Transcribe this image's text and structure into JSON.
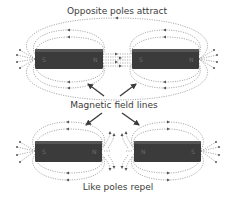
{
  "labels": {
    "top": "Opposite poles attract",
    "middle": "Magnetic field lines",
    "bottom": "Like poles repel"
  },
  "magnets": {
    "attract": [
      {
        "left_pole": "S",
        "right_pole": "N"
      },
      {
        "left_pole": "S",
        "right_pole": "N"
      }
    ],
    "repel": [
      {
        "left_pole": "S",
        "right_pole": "N"
      },
      {
        "left_pole": "N",
        "right_pole": "S"
      }
    ]
  },
  "colors": {
    "magnet": "#3b3b3b",
    "field_line": "#8a8a8a",
    "text": "#3a3a3a"
  }
}
